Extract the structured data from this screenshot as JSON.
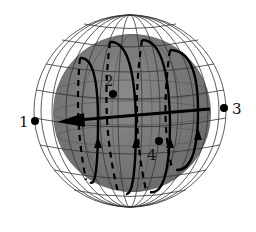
{
  "diagram": {
    "colors": {
      "background": "#ffffff",
      "inner_sphere": "#7a7a7a",
      "wireframe": "#333333",
      "loops": "#000000"
    },
    "points": [
      {
        "label": "1",
        "x": 35,
        "y": 121
      },
      {
        "label": "2",
        "x": 113,
        "y": 94
      },
      {
        "label": "3",
        "x": 224,
        "y": 108
      },
      {
        "label": "4",
        "x": 159,
        "y": 141
      }
    ],
    "axis_arrow": {
      "from": [
        210,
        109
      ],
      "to": [
        57,
        122
      ],
      "direction": "left"
    }
  }
}
